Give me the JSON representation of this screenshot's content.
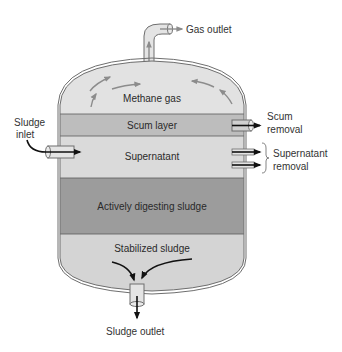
{
  "diagram": {
    "type": "anaerobic-digester-cross-section",
    "colors": {
      "background": "#ffffff",
      "tank_outline": "#6e6e6e",
      "methane_gas": "#e2e2e2",
      "scum_layer": "#bdbdbd",
      "supernatant": "#dadada",
      "active_sludge": "#9c9c9c",
      "stabilized_sludge": "#d4d4d4",
      "gas_arrows": "#8c8c8c",
      "flow_arrows": "#111111",
      "text": "#333333"
    },
    "layers": [
      {
        "id": "methane",
        "label": "Methane gas"
      },
      {
        "id": "scum",
        "label": "Scum layer"
      },
      {
        "id": "supernatant",
        "label": "Supernatant"
      },
      {
        "id": "active",
        "label": "Actively digesting sludge"
      },
      {
        "id": "stabilized",
        "label": "Stabilized sludge"
      }
    ],
    "external_labels": {
      "gas_outlet": "Gas outlet",
      "sludge_inlet_line1": "Sludge",
      "sludge_inlet_line2": "inlet",
      "scum_removal_line1": "Scum",
      "scum_removal_line2": "removal",
      "supernatant_removal_line1": "Supernatant",
      "supernatant_removal_line2": "removal",
      "sludge_outlet": "Sludge outlet"
    }
  }
}
